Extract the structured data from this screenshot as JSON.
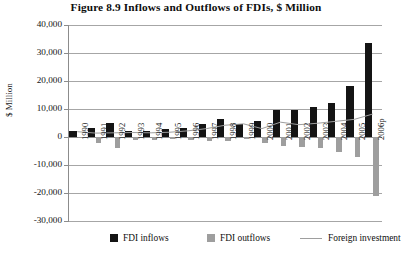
{
  "title": "Figure 8.9  Inflows and Outflows of FDIs, $ Million",
  "y_axis_title": "$ Million",
  "legend": {
    "inflows": "FDI inflows",
    "outflows": "FDI outflows",
    "line": "Foreign investment"
  },
  "colors": {
    "inflows": "#141414",
    "outflows": "#9e9e9e",
    "line": "#9e9e9e",
    "grid": "#a6a6a6",
    "text": "#141414"
  },
  "y_ticks": [
    "40,000",
    "30,000",
    "20,000",
    "10,000",
    "0",
    "-10,000",
    "-20,000",
    "-30,000"
  ],
  "chart_data": {
    "type": "bar",
    "title": "Figure 8.9  Inflows and Outflows of FDIs, $ Million",
    "xlabel": "",
    "ylabel": "$ Million",
    "ylim": [
      -30000,
      40000
    ],
    "ytick_values": [
      40000,
      30000,
      20000,
      10000,
      0,
      -10000,
      -20000,
      -30000
    ],
    "grid": true,
    "legend_position": "bottom",
    "categories": [
      "1990",
      "1991",
      "1992",
      "1993",
      "1994",
      "1995",
      "1996",
      "1997",
      "1998",
      "1999",
      "2000",
      "2001",
      "2002",
      "2003",
      "2004",
      "2005",
      "2006p"
    ],
    "series": [
      {
        "name": "FDI inflows",
        "type": "bar",
        "color": "#141414",
        "values": [
          2100,
          3300,
          4900,
          2300,
          2100,
          2800,
          3200,
          4700,
          6300,
          4800,
          5600,
          9700,
          9600,
          10700,
          12100,
          18200,
          33500
        ]
      },
      {
        "name": "FDI outflows",
        "type": "bar",
        "color": "#9e9e9e",
        "values": [
          -500,
          -2200,
          -4100,
          -1100,
          -900,
          -700,
          -900,
          -1500,
          -1400,
          -800,
          -2300,
          -3200,
          -3400,
          -4100,
          -5500,
          -7300,
          -21200
        ]
      },
      {
        "name": "Foreign investment",
        "type": "line",
        "color": "#9e9e9e",
        "values": [
          1900,
          1400,
          1500,
          1600,
          1500,
          1700,
          2200,
          3000,
          4200,
          4700,
          3000,
          5300,
          4400,
          4900,
          5600,
          6300,
          8200
        ]
      }
    ]
  }
}
